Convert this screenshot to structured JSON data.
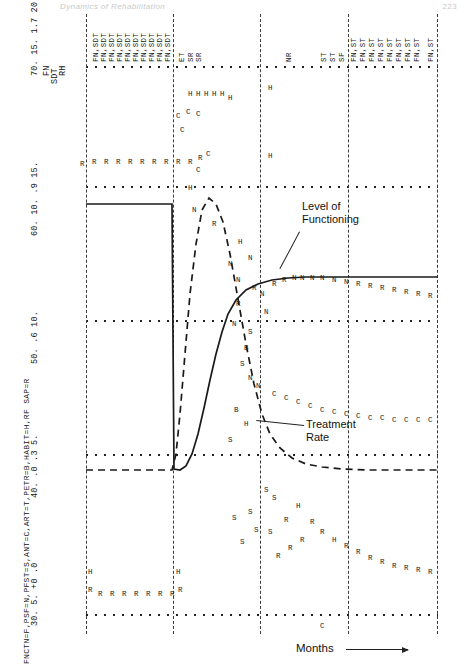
{
  "page": {
    "running_head": "Dynamics of Rehabilitation",
    "folio": "223"
  },
  "legend": {
    "text": "FNCTN=F,PSF=N,PFST=S,ANT=C,ART=T,PETR=B,HABIT=H,RF SAP=R"
  },
  "annotations": {
    "level_of_functioning_line1": "Level of",
    "level_of_functioning_line2": "Functioning",
    "treatment_rate_line1": "Treatment",
    "treatment_rate_line2": "Rate"
  },
  "axis": {
    "x_label": "Months",
    "x_ticks": [
      "0",
      "10",
      "20",
      "30",
      "40"
    ]
  },
  "tick_blocks": [
    {
      "id": "t70",
      "labels": "70.  15.  1.7  20."
    },
    {
      "id": "t60",
      "labels": "60.  10.  .9  15."
    },
    {
      "id": "t50",
      "labels": "50.  .6  10."
    },
    {
      "id": "t40",
      "labels": "40.  .0  .3  5."
    },
    {
      "id": "t30",
      "labels": "30.  5.  +0  .0"
    }
  ],
  "tick_headers": {
    "fn": "FN",
    "sdt": "SDT",
    "rh": "RH"
  },
  "glyph_columns": [
    {
      "id": "g1",
      "text": "FN,SDT"
    },
    {
      "id": "g2",
      "text": "FN,SDT"
    },
    {
      "id": "g3",
      "text": "FN,SDT"
    },
    {
      "id": "g4",
      "text": "FN,SDT"
    },
    {
      "id": "g5",
      "text": "FN,SDT"
    },
    {
      "id": "g6",
      "text": "FN,SDT"
    },
    {
      "id": "g7",
      "text": "FN,SDT"
    },
    {
      "id": "g8",
      "text": "FN,SDT"
    },
    {
      "id": "g9",
      "text": "FN,SDT"
    },
    {
      "id": "g10",
      "text": "FN,SDT"
    },
    {
      "id": "g11",
      "text": "ET"
    },
    {
      "id": "g12",
      "text": "SR"
    },
    {
      "id": "g13",
      "text": "SR"
    },
    {
      "id": "g14",
      "text": "NR"
    },
    {
      "id": "g15",
      "text": "ST"
    },
    {
      "id": "g16",
      "text": "ST"
    },
    {
      "id": "g17",
      "text": "SF"
    },
    {
      "id": "g18",
      "text": "FN,ST"
    },
    {
      "id": "g19",
      "text": "FN,ST"
    },
    {
      "id": "g20",
      "text": "FN,ST"
    },
    {
      "id": "g21",
      "text": "FN,ST"
    },
    {
      "id": "g22",
      "text": "FN,ST"
    },
    {
      "id": "g23",
      "text": "FN,ST"
    },
    {
      "id": "g24",
      "text": "FN,ST"
    },
    {
      "id": "g25",
      "text": "FN,ST"
    },
    {
      "id": "g26",
      "text": "FN,ST"
    }
  ],
  "chart_data": {
    "type": "line",
    "title": "",
    "xlabel": "Months",
    "ylabel": "",
    "xlim": [
      0,
      44
    ],
    "legend_position": "inline-callout",
    "grid": "dotted-rails-and-dashed-verticals",
    "series": [
      {
        "name": "Level of Functioning",
        "style": "solid",
        "x": [
          0,
          2,
          4,
          6,
          8,
          10,
          11,
          12,
          13,
          14,
          15,
          16,
          17,
          18,
          19,
          20,
          21,
          22,
          24,
          26,
          28,
          30,
          34,
          38,
          42,
          44
        ],
        "y": [
          60,
          60,
          60,
          60,
          60,
          60,
          40,
          40,
          40,
          41,
          44,
          48,
          52,
          55,
          57,
          59,
          61,
          63,
          65,
          66,
          66,
          66,
          66,
          66,
          66,
          66
        ]
      },
      {
        "name": "Treatment Rate",
        "style": "dashed",
        "x": [
          0,
          2,
          4,
          6,
          8,
          10,
          11,
          12,
          13,
          14,
          15,
          16,
          17,
          18,
          19,
          20,
          21,
          22,
          24,
          26,
          28,
          30,
          34,
          38,
          42,
          44
        ],
        "y": [
          40,
          40,
          40,
          40,
          40,
          40,
          42,
          52,
          62,
          68,
          66,
          60,
          55,
          51,
          48,
          46,
          44,
          43,
          42,
          41,
          40.5,
          40,
          40,
          40,
          40,
          40
        ]
      }
    ],
    "scatter_glyphs": [
      {
        "char": "R",
        "meaning": "RF SAP"
      },
      {
        "char": "H",
        "meaning": "HABIT"
      },
      {
        "char": "C",
        "meaning": "ANT"
      },
      {
        "char": "S",
        "meaning": "PFST"
      },
      {
        "char": "N",
        "meaning": "PSF"
      },
      {
        "char": "T",
        "meaning": "ART"
      },
      {
        "char": "B",
        "meaning": "PETR"
      },
      {
        "char": "F",
        "meaning": "FNCTN"
      }
    ]
  }
}
